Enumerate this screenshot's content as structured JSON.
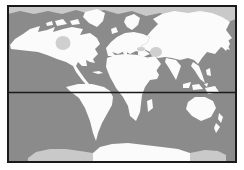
{
  "figure": {
    "kind": "world map",
    "projection": "rectangular world outline",
    "colors": {
      "page_bg": "#ffffff",
      "ocean": "#8b8b8b",
      "land": "#fbfbfb",
      "polar_shading": "#c9c9c9",
      "inland_sea_shading": "#cfcfcf",
      "frame": "#1a1a1a",
      "equator": "#1a1a1a"
    },
    "features": {
      "equator_line": true,
      "border_frame": true,
      "landmasses": [
        "North America",
        "Greenland",
        "South America",
        "Europe",
        "Scandinavia",
        "British Isles",
        "Africa",
        "Madagascar",
        "Asia",
        "Arabia",
        "India",
        "Southeast Asia",
        "Japan",
        "Philippines",
        "Indonesia",
        "New Guinea",
        "Australia",
        "New Zealand",
        "Antarctica"
      ],
      "shaded_regions": [
        "Arctic Ocean band",
        "Antarctica west flank",
        "Antarctica east flank",
        "Hudson Bay",
        "Caspian region",
        "Black Sea region"
      ]
    }
  }
}
